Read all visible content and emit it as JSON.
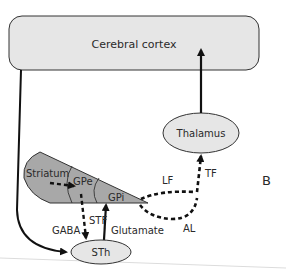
{
  "figure": {
    "panel_label": "B",
    "colors": {
      "box_fill": "#e6e6e6",
      "wedge_fill": "#a8a8a8",
      "stroke": "#111111",
      "page_edge": "#d8d8d8"
    },
    "nodes": {
      "cortex": "Cerebral cortex",
      "thalamus": "Thalamus",
      "striatum": "Striatum",
      "gpe": "GPe",
      "gpi": "GPi",
      "sth": "STh"
    },
    "edge_labels": {
      "lf": "LF",
      "tf": "TF",
      "al": "AL",
      "stf": "STF",
      "gaba": "GABA",
      "glutamate": "Glutamate"
    }
  }
}
